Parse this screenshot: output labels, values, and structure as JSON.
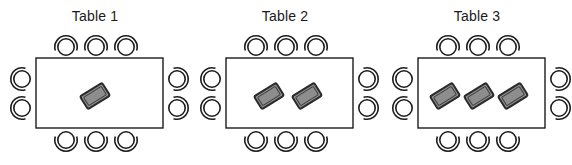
{
  "diagram": {
    "type": "seating-layout",
    "background_color": "#ffffff",
    "line_color": "#1c1c1c",
    "device_fill_color": "#8d8d8d",
    "canvas": {
      "width": 572,
      "height": 165
    },
    "tables": [
      {
        "id": "table-1",
        "title": "Table 1",
        "offset_x": 0,
        "chair_count": 10,
        "chairs_top": 3,
        "chairs_bottom": 3,
        "chairs_left": 2,
        "chairs_right": 2,
        "device_count": 1,
        "devices": [
          {
            "cx": 95,
            "cy": 96,
            "rotation": -32
          }
        ]
      },
      {
        "id": "table-2",
        "title": "Table 2",
        "offset_x": 190,
        "chair_count": 10,
        "chairs_top": 3,
        "chairs_bottom": 3,
        "chairs_left": 2,
        "chairs_right": 2,
        "device_count": 2,
        "devices": [
          {
            "cx": 79,
            "cy": 96,
            "rotation": -32
          },
          {
            "cx": 117,
            "cy": 96,
            "rotation": -32
          }
        ]
      },
      {
        "id": "table-3",
        "title": "Table 3",
        "offset_x": 382,
        "chair_count": 10,
        "chairs_top": 3,
        "chairs_bottom": 3,
        "chairs_left": 2,
        "chairs_right": 2,
        "device_count": 3,
        "devices": [
          {
            "cx": 63,
            "cy": 96,
            "rotation": -32
          },
          {
            "cx": 97,
            "cy": 96,
            "rotation": -32
          },
          {
            "cx": 131,
            "cy": 96,
            "rotation": -32
          }
        ]
      }
    ]
  }
}
